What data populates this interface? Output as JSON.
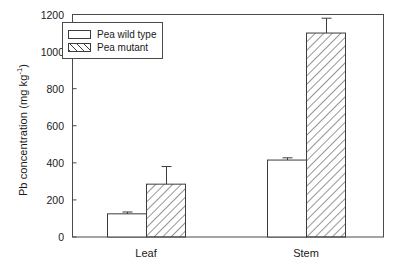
{
  "chart_data": {
    "type": "bar",
    "title": "",
    "xlabel": "",
    "ylabel": "Pb concentration (mg kg",
    "ylabel_sup": "-1",
    "ylabel_suffix": ")",
    "categories": [
      "Leaf",
      "Stem"
    ],
    "ylim": [
      0,
      1200
    ],
    "yticks": [
      0,
      200,
      400,
      600,
      800,
      1000,
      1200
    ],
    "ytick_labels": [
      "0",
      "200",
      "400",
      "600",
      "800",
      "1000",
      "1200"
    ],
    "grid": false,
    "legend_position": "top-left",
    "series": [
      {
        "name": "Pea wild type",
        "fill": "white",
        "values": [
          125,
          415
        ],
        "errors": [
          10,
          12
        ]
      },
      {
        "name": "Pea mutant",
        "fill": "diagonal-hatch",
        "values": [
          285,
          1100
        ],
        "errors": [
          95,
          80
        ]
      }
    ]
  },
  "legend": {
    "items": [
      {
        "label": "Pea wild type",
        "style": "white"
      },
      {
        "label": "Pea mutant",
        "style": "hatched"
      }
    ]
  },
  "colors": {
    "axis": "#4a4a4a",
    "bar_outline": "#3d3d3d",
    "background": "#ffffff",
    "text": "#1a1a1a"
  }
}
